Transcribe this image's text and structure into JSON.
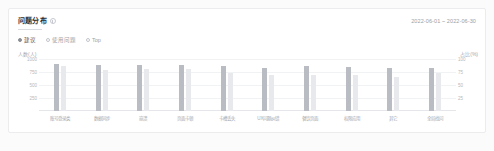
{
  "card": {
    "title": "问题分布",
    "info_icon": "info-icon",
    "date_range": "2022-06-01 ~ 2022-06-30"
  },
  "filters": {
    "options": [
      {
        "label": "建议",
        "selected": true
      },
      {
        "label": "使用问题",
        "selected": false
      },
      {
        "label": "Top",
        "selected": false
      }
    ]
  },
  "chart_data": {
    "type": "bar",
    "title": "问题分布",
    "xlabel": "",
    "ylabel": "人数(人)",
    "y2label": "占比(%)",
    "ylim": [
      0,
      1000
    ],
    "y2lim": [
      0,
      100
    ],
    "yticks": [
      "1000",
      "750",
      "500",
      "250"
    ],
    "y2ticks": [
      "100",
      "75",
      "50",
      "25"
    ],
    "grid": true,
    "legend_position": "none",
    "categories": [
      "账号登录类",
      "数据同步",
      "崩溃",
      "页面卡顿",
      "卡槽丢失",
      "UX问题纠错",
      "餐饮页面",
      "权限应用",
      "其它",
      "全局找问"
    ],
    "series": [
      {
        "name": "人数",
        "axis": "left",
        "color": "#b9bcc2",
        "values": [
          900,
          880,
          880,
          890,
          870,
          830,
          860,
          840,
          820,
          830
        ]
      },
      {
        "name": "对比人数",
        "axis": "left",
        "color": "#e7e9ec",
        "values": [
          860,
          790,
          800,
          810,
          740,
          700,
          690,
          700,
          660,
          730
        ]
      },
      {
        "name": "占比",
        "axis": "right",
        "type": "line",
        "color": "#9a9ea5",
        "values": [
          47,
          47,
          46,
          46,
          46,
          47,
          47,
          47,
          48,
          49
        ]
      }
    ]
  }
}
